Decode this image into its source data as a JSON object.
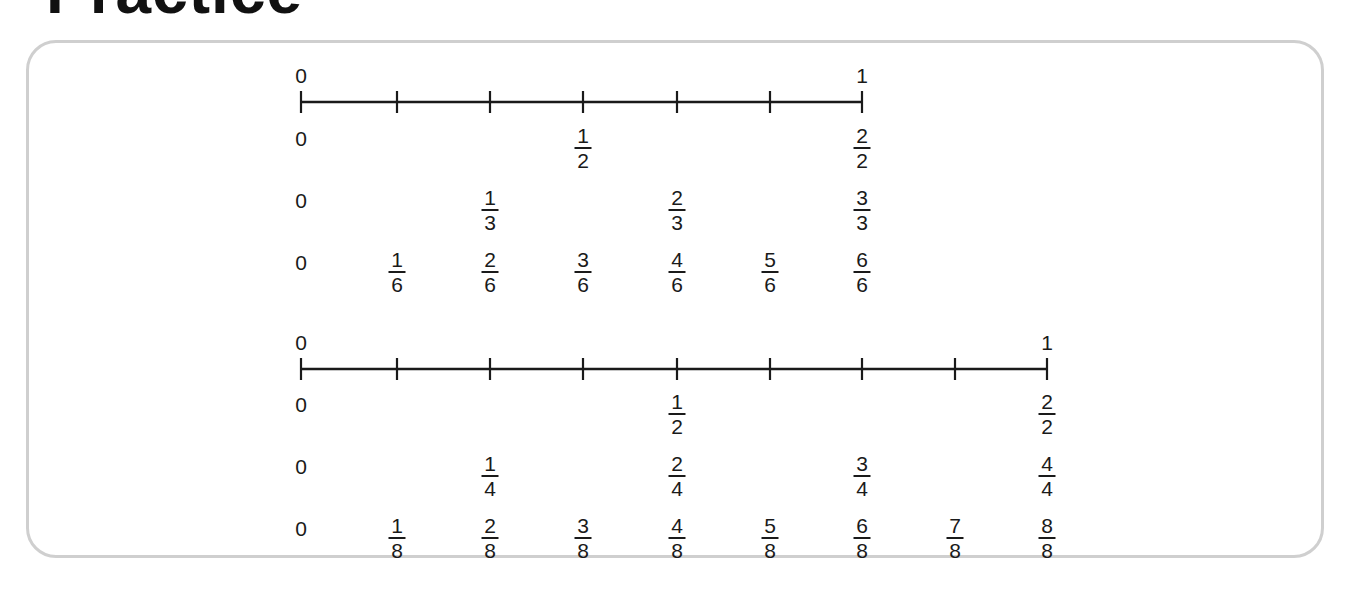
{
  "title": "Practice",
  "number_lines": [
    {
      "id": "line-sixths",
      "start_label": "0",
      "end_label": "1",
      "y": 102,
      "x_start": 301,
      "x_end": 862,
      "ticks": [
        301,
        397,
        490,
        583,
        677,
        770,
        862
      ],
      "rows": [
        {
          "denominator": "2",
          "y": 126,
          "zero": "0",
          "fractions": [
            {
              "num": "1",
              "den": "2",
              "x": 583
            },
            {
              "num": "2",
              "den": "2",
              "x": 862
            }
          ]
        },
        {
          "denominator": "3",
          "y": 188,
          "zero": "0",
          "fractions": [
            {
              "num": "1",
              "den": "3",
              "x": 490
            },
            {
              "num": "2",
              "den": "3",
              "x": 677
            },
            {
              "num": "3",
              "den": "3",
              "x": 862
            }
          ]
        },
        {
          "denominator": "6",
          "y": 250,
          "zero": "0",
          "fractions": [
            {
              "num": "1",
              "den": "6",
              "x": 397
            },
            {
              "num": "2",
              "den": "6",
              "x": 490
            },
            {
              "num": "3",
              "den": "6",
              "x": 583
            },
            {
              "num": "4",
              "den": "6",
              "x": 677
            },
            {
              "num": "5",
              "den": "6",
              "x": 770
            },
            {
              "num": "6",
              "den": "6",
              "x": 862
            }
          ]
        }
      ]
    },
    {
      "id": "line-eighths",
      "start_label": "0",
      "end_label": "1",
      "y": 369,
      "x_start": 301,
      "x_end": 1047,
      "ticks": [
        301,
        397,
        490,
        583,
        677,
        770,
        862,
        955,
        1047
      ],
      "rows": [
        {
          "denominator": "2",
          "y": 392,
          "zero": "0",
          "fractions": [
            {
              "num": "1",
              "den": "2",
              "x": 677
            },
            {
              "num": "2",
              "den": "2",
              "x": 1047
            }
          ]
        },
        {
          "denominator": "4",
          "y": 454,
          "zero": "0",
          "fractions": [
            {
              "num": "1",
              "den": "4",
              "x": 490
            },
            {
              "num": "2",
              "den": "4",
              "x": 677
            },
            {
              "num": "3",
              "den": "4",
              "x": 862
            },
            {
              "num": "4",
              "den": "4",
              "x": 1047
            }
          ]
        },
        {
          "denominator": "8",
          "y": 516,
          "zero": "0",
          "fractions": [
            {
              "num": "1",
              "den": "8",
              "x": 397
            },
            {
              "num": "2",
              "den": "8",
              "x": 490
            },
            {
              "num": "3",
              "den": "8",
              "x": 583
            },
            {
              "num": "4",
              "den": "8",
              "x": 677
            },
            {
              "num": "5",
              "den": "8",
              "x": 770
            },
            {
              "num": "6",
              "den": "8",
              "x": 862
            },
            {
              "num": "7",
              "den": "8",
              "x": 955
            },
            {
              "num": "8",
              "den": "8",
              "x": 1047
            }
          ]
        }
      ]
    }
  ]
}
